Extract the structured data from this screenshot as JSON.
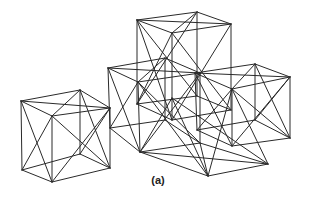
{
  "figure": {
    "label": "(a)",
    "stroke_color": "#2a2a2a",
    "background": "#ffffff"
  },
  "vertices": {
    "A1": [
      137,
      20
    ],
    "A2": [
      197,
      12
    ],
    "A3": [
      231,
      24
    ],
    "A4": [
      172,
      33
    ],
    "A5": [
      137,
      104
    ],
    "A6": [
      197,
      96
    ],
    "A7": [
      231,
      110
    ],
    "A8": [
      172,
      120
    ],
    "B1": [
      108,
      68
    ],
    "B2": [
      165,
      58
    ],
    "B3": [
      200,
      73
    ],
    "B4": [
      138,
      82
    ],
    "B5": [
      110,
      128
    ],
    "B6": [
      165,
      120
    ],
    "B7": [
      200,
      143
    ],
    "B8": [
      140,
      152
    ],
    "C1": [
      21,
      101
    ],
    "C2": [
      80,
      90
    ],
    "C3": [
      110,
      108
    ],
    "C4": [
      52,
      116
    ],
    "C5": [
      22,
      170
    ],
    "C6": [
      80,
      154
    ],
    "C7": [
      110,
      168
    ],
    "C8": [
      52,
      182
    ],
    "D1": [
      195,
      73
    ],
    "D2": [
      255,
      64
    ],
    "D3": [
      290,
      77
    ],
    "D4": [
      232,
      89
    ],
    "D5": [
      197,
      130
    ],
    "D6": [
      255,
      120
    ],
    "D7": [
      290,
      138
    ],
    "D8": [
      232,
      146
    ],
    "E1": [
      138,
      82
    ],
    "E2": [
      200,
      73
    ],
    "E3": [
      232,
      89
    ],
    "E4": [
      172,
      98
    ],
    "E5": [
      140,
      152
    ],
    "E6": [
      200,
      143
    ],
    "E7": [
      268,
      164
    ],
    "E8": [
      208,
      176
    ]
  },
  "edges": [
    [
      "A1",
      "A2"
    ],
    [
      "A2",
      "A3"
    ],
    [
      "A3",
      "A4"
    ],
    [
      "A4",
      "A1"
    ],
    [
      "A1",
      "A5"
    ],
    [
      "A2",
      "A6"
    ],
    [
      "A3",
      "A7"
    ],
    [
      "A4",
      "A8"
    ],
    [
      "A5",
      "A6"
    ],
    [
      "A6",
      "A7"
    ],
    [
      "A7",
      "A8"
    ],
    [
      "A8",
      "A5"
    ],
    [
      "A1",
      "A3"
    ],
    [
      "A2",
      "A4"
    ],
    [
      "A1",
      "A8"
    ],
    [
      "A4",
      "A5"
    ],
    [
      "A3",
      "A8"
    ],
    [
      "A4",
      "A7"
    ],
    [
      "A1",
      "A6"
    ],
    [
      "A2",
      "A5"
    ],
    [
      "B1",
      "B2"
    ],
    [
      "B2",
      "B3"
    ],
    [
      "B3",
      "B4"
    ],
    [
      "B4",
      "B1"
    ],
    [
      "B1",
      "B5"
    ],
    [
      "B2",
      "B6"
    ],
    [
      "B3",
      "B7"
    ],
    [
      "B4",
      "B8"
    ],
    [
      "B5",
      "B6"
    ],
    [
      "B6",
      "B7"
    ],
    [
      "B7",
      "B8"
    ],
    [
      "B8",
      "B5"
    ],
    [
      "B1",
      "B3"
    ],
    [
      "B2",
      "B4"
    ],
    [
      "B1",
      "B8"
    ],
    [
      "B4",
      "B5"
    ],
    [
      "B3",
      "B8"
    ],
    [
      "B4",
      "B7"
    ],
    [
      "C1",
      "C2"
    ],
    [
      "C2",
      "C3"
    ],
    [
      "C3",
      "C4"
    ],
    [
      "C4",
      "C1"
    ],
    [
      "C1",
      "C5"
    ],
    [
      "C2",
      "C6"
    ],
    [
      "C3",
      "C7"
    ],
    [
      "C4",
      "C8"
    ],
    [
      "C5",
      "C6"
    ],
    [
      "C6",
      "C7"
    ],
    [
      "C7",
      "C8"
    ],
    [
      "C8",
      "C5"
    ],
    [
      "C1",
      "C3"
    ],
    [
      "C2",
      "C4"
    ],
    [
      "C1",
      "C8"
    ],
    [
      "C4",
      "C5"
    ],
    [
      "C3",
      "C8"
    ],
    [
      "C4",
      "C7"
    ],
    [
      "C2",
      "C7"
    ],
    [
      "C3",
      "C6"
    ],
    [
      "D1",
      "D2"
    ],
    [
      "D2",
      "D3"
    ],
    [
      "D3",
      "D4"
    ],
    [
      "D4",
      "D1"
    ],
    [
      "D1",
      "D5"
    ],
    [
      "D2",
      "D6"
    ],
    [
      "D3",
      "D7"
    ],
    [
      "D4",
      "D8"
    ],
    [
      "D5",
      "D6"
    ],
    [
      "D6",
      "D7"
    ],
    [
      "D7",
      "D8"
    ],
    [
      "D8",
      "D5"
    ],
    [
      "D1",
      "D3"
    ],
    [
      "D2",
      "D4"
    ],
    [
      "D1",
      "D8"
    ],
    [
      "D4",
      "D5"
    ],
    [
      "D3",
      "D8"
    ],
    [
      "D4",
      "D7"
    ],
    [
      "D2",
      "D7"
    ],
    [
      "D3",
      "D6"
    ],
    [
      "E4",
      "E8"
    ],
    [
      "E5",
      "E8"
    ],
    [
      "E8",
      "E7"
    ],
    [
      "E6",
      "E7"
    ],
    [
      "E3",
      "E7"
    ],
    [
      "E4",
      "E5"
    ],
    [
      "E1",
      "E8"
    ],
    [
      "E4",
      "E7"
    ],
    [
      "E3",
      "E8"
    ],
    [
      "E5",
      "E7"
    ],
    [
      "E6",
      "E8"
    ]
  ]
}
